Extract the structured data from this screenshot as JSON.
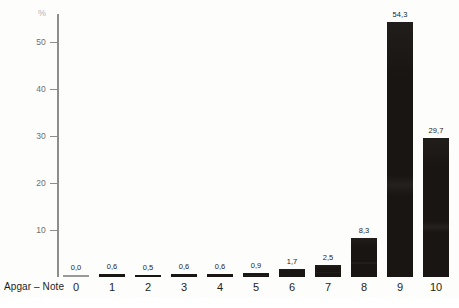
{
  "chart_data": {
    "type": "bar",
    "title": "",
    "subtitle": "",
    "xlabel": "Apgar – Note",
    "ylabel": "%",
    "categories": [
      "0",
      "1",
      "2",
      "3",
      "4",
      "5",
      "6",
      "7",
      "8",
      "9",
      "10"
    ],
    "values": [
      0.0,
      0.6,
      0.5,
      0.6,
      0.6,
      0.9,
      1.7,
      2.5,
      8.3,
      54.3,
      29.7
    ],
    "value_labels": [
      "0,0",
      "0,6",
      "0,5",
      "0,6",
      "0,6",
      "0,9",
      "1,7",
      "2,5",
      "8,3",
      "54,3",
      "29,7"
    ],
    "ylim": [
      0,
      56
    ],
    "y_ticks": [
      10,
      20,
      30,
      40,
      50
    ],
    "y_tick_labels": [
      "10",
      "20",
      "30",
      "40",
      "50"
    ],
    "grid": false,
    "legend": null,
    "bar_color": "#191512",
    "zero_bar_color": "#9a9a9a",
    "axis_color": "#8d8d8d",
    "label_color": "#1d1d1d",
    "unit_color": "#b4b4b4"
  }
}
